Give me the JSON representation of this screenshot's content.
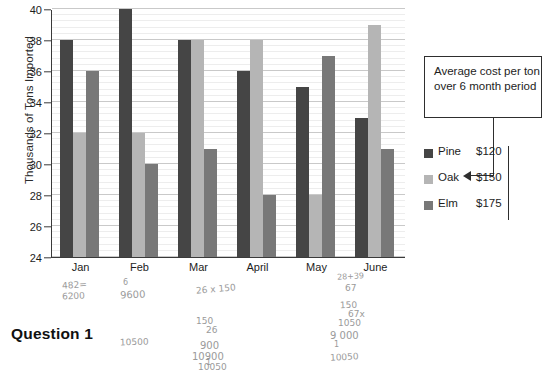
{
  "chart_data": {
    "type": "bar",
    "title": "",
    "xlabel": "",
    "ylabel": "Thousands of Tons Imported",
    "ylim": [
      24,
      40
    ],
    "ytick_step": 2,
    "yticks": [
      24,
      26,
      28,
      30,
      32,
      34,
      36,
      38,
      40
    ],
    "grid": true,
    "legend_position": "right",
    "categories": [
      "Jan",
      "Feb",
      "Mar",
      "April",
      "May",
      "June"
    ],
    "series": [
      {
        "name": "Pine",
        "color": "#454545",
        "values": [
          38,
          40,
          38,
          36,
          35,
          33
        ]
      },
      {
        "name": "Oak",
        "color": "#b5b5b5",
        "values": [
          32,
          32,
          38,
          38,
          28,
          39
        ]
      },
      {
        "name": "Elm",
        "color": "#787878",
        "values": [
          36,
          30,
          31,
          28,
          37,
          31
        ]
      }
    ]
  },
  "axis": {
    "y_title": "Thousands of Tons Imported",
    "y_labels": [
      "40",
      "38",
      "36",
      "34",
      "32",
      "30",
      "28",
      "26",
      "24"
    ],
    "x_labels": [
      "Jan",
      "Feb",
      "Mar",
      "April",
      "May",
      "June"
    ]
  },
  "callout": {
    "text": "Average cost per ton over 6 month period"
  },
  "legend": {
    "rows": [
      {
        "name": "Pine",
        "price": "$120",
        "swatch": "pine"
      },
      {
        "name": "Oak",
        "price": "$150",
        "swatch": "oak"
      },
      {
        "name": "Elm",
        "price": "$175",
        "swatch": "elm"
      }
    ]
  },
  "footer": {
    "question_label": "Question 1"
  },
  "handwriting": [
    {
      "text": "482=",
      "x": 62,
      "y": 280,
      "size": 9,
      "rot": -4
    },
    {
      "text": "6200",
      "x": 62,
      "y": 291,
      "size": 9,
      "rot": -3
    },
    {
      "text": "6",
      "x": 123,
      "y": 278,
      "size": 8,
      "rot": 0
    },
    {
      "text": "9600",
      "x": 120,
      "y": 289,
      "size": 10,
      "rot": -2
    },
    {
      "text": "10500",
      "x": 120,
      "y": 337,
      "size": 9,
      "rot": -2
    },
    {
      "text": "26 x 150",
      "x": 196,
      "y": 284,
      "size": 9,
      "rot": -5
    },
    {
      "text": "150",
      "x": 196,
      "y": 316,
      "size": 9,
      "rot": 0
    },
    {
      "text": "26",
      "x": 206,
      "y": 325,
      "size": 9,
      "rot": 0
    },
    {
      "text": "900",
      "x": 200,
      "y": 340,
      "size": 10,
      "rot": 0
    },
    {
      "text": "10900",
      "x": 192,
      "y": 351,
      "size": 10,
      "rot": 0
    },
    {
      "text": "1",
      "x": 206,
      "y": 358,
      "size": 8,
      "rot": 0
    },
    {
      "text": "10050",
      "x": 198,
      "y": 362,
      "size": 9,
      "rot": 0
    },
    {
      "text": "28+39",
      "x": 337,
      "y": 272,
      "size": 8,
      "rot": -3
    },
    {
      "text": "67",
      "x": 345,
      "y": 283,
      "size": 9,
      "rot": 0
    },
    {
      "text": "150",
      "x": 340,
      "y": 300,
      "size": 9,
      "rot": -2
    },
    {
      "text": "67x",
      "x": 348,
      "y": 309,
      "size": 9,
      "rot": 0
    },
    {
      "text": "1050",
      "x": 338,
      "y": 318,
      "size": 9,
      "rot": 0
    },
    {
      "text": "9 000",
      "x": 330,
      "y": 330,
      "size": 10,
      "rot": 0
    },
    {
      "text": "1",
      "x": 334,
      "y": 340,
      "size": 8,
      "rot": 0
    },
    {
      "text": "10050",
      "x": 330,
      "y": 352,
      "size": 9,
      "rot": -3
    }
  ]
}
